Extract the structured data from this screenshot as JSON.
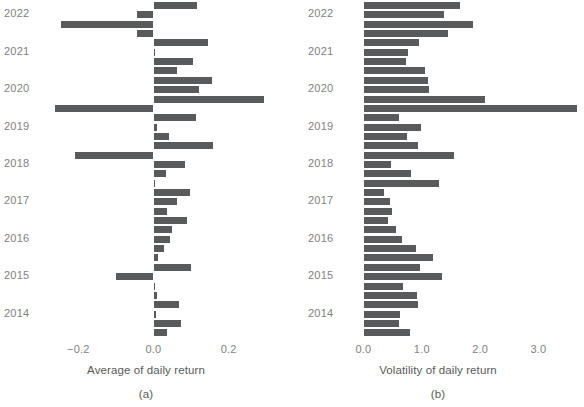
{
  "figure": {
    "panels": [
      {
        "id": "a",
        "caption": "(a)",
        "xlabel": "Average of daily return",
        "xticks": [
          "-0.2",
          "0.0",
          "0.2"
        ],
        "xtick_values": [
          -0.2,
          0.0,
          0.2
        ],
        "yticks": [
          "2022",
          "2021",
          "2020",
          "2019",
          "2018",
          "2017",
          "2016",
          "2015",
          "2014"
        ]
      },
      {
        "id": "b",
        "caption": "(b)",
        "xlabel": "Volatility of daily return",
        "xticks": [
          "0.0",
          "1.0",
          "2.0",
          "3.0"
        ],
        "xtick_values": [
          0.0,
          1.0,
          2.0,
          3.0
        ],
        "yticks": [
          "2022",
          "2021",
          "2020",
          "2019",
          "2018",
          "2017",
          "2016",
          "2015",
          "2014"
        ]
      }
    ],
    "bar_color": "#595a5c",
    "text_color": "#58595b",
    "tick_color": "#808184"
  },
  "chart_data": [
    {
      "type": "bar",
      "orientation": "horizontal",
      "title": "",
      "xlabel": "Average of daily return",
      "ylabel": "",
      "caption": "(a)",
      "xlim": [
        -0.28,
        0.3
      ],
      "grid": false,
      "legend": false,
      "categories": [
        "2022",
        "2021",
        "2020",
        "2019",
        "2018",
        "2017",
        "2016",
        "2015",
        "2014"
      ],
      "category_tick_positions": [
        1,
        5,
        9,
        13,
        17,
        21,
        25,
        29,
        33
      ],
      "values": [
        0.115,
        -0.045,
        -0.245,
        -0.045,
        0.145,
        0.002,
        0.105,
        0.063,
        0.155,
        0.12,
        0.295,
        -0.262,
        0.113,
        0.01,
        0.04,
        0.158,
        -0.21,
        0.085,
        0.032,
        0.005,
        0.098,
        0.062,
        0.036,
        0.09,
        0.048,
        0.045,
        0.027,
        0.012,
        0.1,
        -0.1,
        0.0,
        0.008,
        0.068,
        0.007,
        0.073,
        0.035
      ]
    },
    {
      "type": "bar",
      "orientation": "horizontal",
      "title": "",
      "xlabel": "Volatility of daily return",
      "ylabel": "",
      "caption": "(b)",
      "xlim": [
        0.0,
        3.8
      ],
      "grid": false,
      "legend": false,
      "categories": [
        "2022",
        "2021",
        "2020",
        "2019",
        "2018",
        "2017",
        "2016",
        "2015",
        "2014"
      ],
      "category_tick_positions": [
        1,
        5,
        9,
        13,
        17,
        21,
        25,
        29,
        33
      ],
      "values": [
        1.65,
        1.38,
        1.87,
        1.45,
        0.96,
        0.76,
        0.73,
        1.06,
        1.11,
        1.13,
        2.09,
        3.66,
        0.61,
        0.99,
        0.75,
        0.93,
        1.56,
        0.48,
        0.82,
        1.3,
        0.35,
        0.46,
        0.49,
        0.42,
        0.55,
        0.66,
        0.9,
        1.2,
        0.97,
        1.35,
        0.67,
        0.92,
        0.93,
        0.62,
        0.61,
        0.79
      ]
    }
  ]
}
